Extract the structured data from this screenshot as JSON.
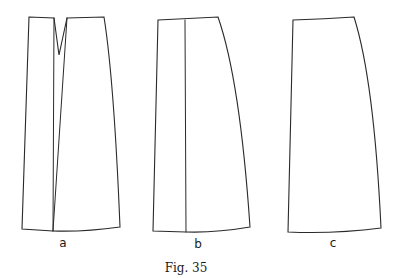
{
  "figure": {
    "caption": "Fig. 35",
    "stroke_color": "#2a2a2a",
    "background": "#ffffff",
    "pieces": [
      {
        "id": "a",
        "label": "a",
        "description": "skirt pattern piece with waist dart and slashed inner lines",
        "outline": "M29,17 L54,18 L59,55 L67,18 L104,17 Q114,80 120,227 Q85,232 53,231 L22,229 Z",
        "inner_lines": [
          "M54,18 L53,231",
          "M67,18 L53,231"
        ],
        "label_pos": [
          63,
          247
        ]
      },
      {
        "id": "b",
        "label": "b",
        "description": "skirt pattern piece with vertical slash line",
        "outline": "M158,20 L218,17 Q240,80 250,227 Q215,233 186,232 L153,231 Z",
        "inner_lines": [
          "M185,20 L186,232"
        ],
        "label_pos": [
          198,
          248
        ]
      },
      {
        "id": "c",
        "label": "c",
        "description": "final skirt pattern piece",
        "outline": "M293,20 Q325,19 354,17 Q374,80 381,228 Q335,234 288,232 Z",
        "inner_lines": [],
        "label_pos": [
          333,
          247
        ]
      }
    ]
  }
}
